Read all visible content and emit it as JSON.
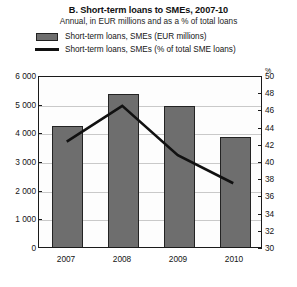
{
  "chart_data": {
    "type": "bar",
    "title": "B. Short-term loans to SMEs, 2007-10",
    "subtitle": "Annual, in EUR millions and as a % of total loans",
    "categories": [
      "2007",
      "2008",
      "2009",
      "2010"
    ],
    "xlabel": "",
    "grid": true,
    "legend_position": "top-left",
    "series": [
      {
        "name": "Short-term loans, SMEs (EUR millions)",
        "type": "bar",
        "axis": "left",
        "color": "#6e6e6e",
        "values": [
          4290,
          5400,
          4980,
          3900
        ]
      },
      {
        "name": "Short-term loans, SMEs (% of total SME loans)",
        "type": "line",
        "axis": "right",
        "color": "#111111",
        "values": [
          42.4,
          46.6,
          40.8,
          37.5
        ]
      }
    ],
    "axes": {
      "left": {
        "label": "",
        "unit": "",
        "min": 0,
        "max": 6000,
        "step": 1000,
        "ticks": [
          "0",
          "1 000",
          "2 000",
          "3 000",
          "4 000",
          "5 000",
          "6 000"
        ]
      },
      "right": {
        "label": "",
        "unit": "%",
        "min": 30,
        "max": 50,
        "step": 2,
        "ticks": [
          "30",
          "32",
          "34",
          "36",
          "38",
          "40",
          "42",
          "44",
          "46",
          "48",
          "50"
        ]
      }
    }
  },
  "legend": {
    "items": [
      {
        "marker": "bar-swatch",
        "label": "Short-term loans, SMEs (EUR millions)"
      },
      {
        "marker": "line-swatch",
        "label": "Short-term loans, SMEs (% of total SME loans)"
      }
    ]
  }
}
